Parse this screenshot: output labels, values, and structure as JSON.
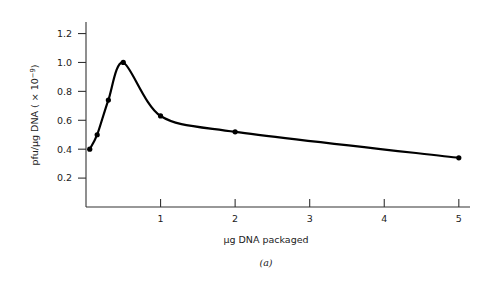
{
  "chart_data": {
    "type": "line",
    "title": "",
    "subtitle": "",
    "xlabel": "µg DNA packaged",
    "ylabel_main": "pfu/µg DNA ( × 10",
    "ylabel_exponent": "−9",
    "ylabel_close": ")",
    "ylabel_full": "pfu/µg DNA ( × 10−9)",
    "caption": "(a)",
    "xlim": [
      0,
      5.15
    ],
    "ylim": [
      0,
      1.28
    ],
    "grid": false,
    "legend": null,
    "x_ticks": [
      1,
      2,
      3,
      4,
      5
    ],
    "x_tick_labels": [
      "1",
      "2",
      "3",
      "4",
      "5"
    ],
    "y_ticks": [
      0.2,
      0.4,
      0.6,
      0.8,
      1.0,
      1.2
    ],
    "y_tick_labels": [
      "0.2",
      "0.4",
      "0.6",
      "0.8",
      "1.0",
      "1.2"
    ],
    "marker": "filled-circle",
    "line_color": "#000000",
    "marker_color": "#000000",
    "axis_color": "#333333",
    "x": [
      0.05,
      0.15,
      0.3,
      0.5,
      1.0,
      2.0,
      5.0
    ],
    "values": [
      0.4,
      0.5,
      0.74,
      1.0,
      0.63,
      0.52,
      0.34
    ],
    "points": [
      {
        "x": 0.05,
        "y": 0.4
      },
      {
        "x": 0.15,
        "y": 0.5
      },
      {
        "x": 0.3,
        "y": 0.74
      },
      {
        "x": 0.5,
        "y": 1.0
      },
      {
        "x": 1.0,
        "y": 0.63
      },
      {
        "x": 2.0,
        "y": 0.52
      },
      {
        "x": 5.0,
        "y": 0.34
      }
    ]
  }
}
